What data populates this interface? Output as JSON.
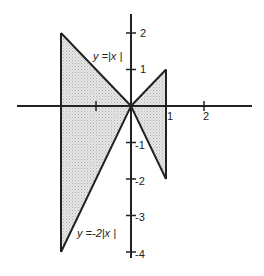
{
  "figure": {
    "type": "region-between-curves",
    "curves": [
      {
        "label": "y =|x |",
        "expression": "y = |x|"
      },
      {
        "label": "y =-2|x |",
        "expression": "y = -2|x|"
      }
    ],
    "shaded_region": {
      "x_from": -2,
      "x_to": 1
    },
    "x_ticks": [
      {
        "value": -2,
        "label": ""
      },
      {
        "value": -1,
        "label": ""
      },
      {
        "value": 1,
        "label": "1"
      },
      {
        "value": 2,
        "label": "2"
      }
    ],
    "y_ticks": [
      {
        "value": 2,
        "label": "2"
      },
      {
        "value": 1,
        "label": "1"
      },
      {
        "value": -1,
        "label": "-1"
      },
      {
        "value": -2,
        "label": "-2"
      },
      {
        "value": -3,
        "label": "-3"
      },
      {
        "value": -4,
        "label": "-4"
      }
    ],
    "colors": {
      "line": "#222222",
      "fill": "#dcdcdc"
    }
  }
}
